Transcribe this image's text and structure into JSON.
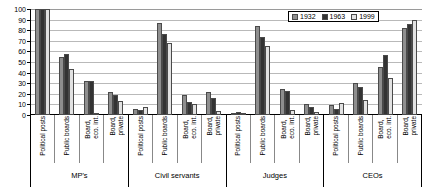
{
  "chart_data": {
    "type": "bar",
    "title": "",
    "xlabel": "",
    "ylabel": "",
    "ylim": [
      0,
      100
    ],
    "ytick_labels": [
      "100",
      "90",
      "80",
      "70",
      "60",
      "50",
      "40",
      "30",
      "20",
      "10",
      "0"
    ],
    "ytick_values": [
      100,
      90,
      80,
      70,
      60,
      50,
      40,
      30,
      20,
      10,
      0
    ],
    "grid": true,
    "legend_position": "top-right",
    "legend": [
      "1932",
      "1963",
      "1999"
    ],
    "series_colors": {
      "1932": "#8e8e8e",
      "1963": "#333333",
      "1999": "#e2e2e2"
    },
    "groups": [
      "MP's",
      "Civil servants",
      "Judges",
      "CEOs"
    ],
    "categories": [
      "Political posts",
      "Public boards",
      "Board, eco. int.",
      "Board, private"
    ],
    "series": [
      {
        "name": "1932",
        "values": [
          [
            100,
            55,
            32,
            22
          ],
          [
            6,
            87,
            19,
            22
          ],
          [
            2,
            84,
            25,
            10
          ],
          [
            9,
            30,
            45,
            82
          ]
        ]
      },
      {
        "name": "1963",
        "values": [
          [
            100,
            58,
            32,
            19
          ],
          [
            5,
            76,
            12,
            16
          ],
          [
            3,
            74,
            23,
            8
          ],
          [
            6,
            26,
            57,
            86
          ]
        ]
      },
      {
        "name": "1999",
        "values": [
          [
            100,
            43,
            2,
            13
          ],
          [
            8,
            68,
            10,
            4
          ],
          [
            2,
            65,
            5,
            3
          ],
          [
            11,
            14,
            35,
            90
          ]
        ]
      }
    ]
  }
}
